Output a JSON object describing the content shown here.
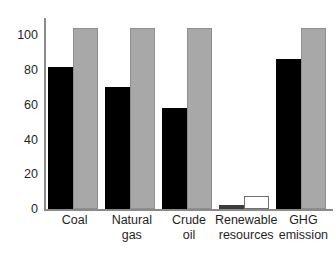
{
  "chart_data": {
    "type": "bar",
    "title": "",
    "subtitle": "",
    "xlabel": "",
    "ylabel": "",
    "ylim": [
      0,
      110
    ],
    "yticks": [
      0,
      20,
      40,
      60,
      80,
      100
    ],
    "ytick_labels": [
      "0",
      "20",
      "40",
      "60",
      "80",
      "100"
    ],
    "grid": false,
    "legend": null,
    "legend_position": "none",
    "categories": [
      "Coal",
      "Natural\ngas",
      "Crude\noil",
      "Renewable\nresources",
      "GHG\nemission"
    ],
    "series": [
      {
        "name": "series-1",
        "color": "#000000",
        "values": [
          82,
          70,
          58,
          2.5,
          86.5
        ]
      },
      {
        "name": "series-2",
        "color": "#a8a8a8",
        "values": [
          104.5,
          104,
          104,
          7.5,
          104
        ]
      }
    ],
    "bar_styles": [
      [
        "black",
        "gray"
      ],
      [
        "black",
        "gray"
      ],
      [
        "black",
        "gray"
      ],
      [
        "darkgray",
        "white"
      ],
      [
        "black",
        "gray"
      ]
    ],
    "colors": {
      "series1_black": "#000000",
      "series1_darkgray": "#3b3b3b",
      "series2_gray": "#a8a8a8",
      "series2_white": "#ffffff",
      "axis": "#8a8a8a",
      "text": "#1f1f1f",
      "background": "#ffffff"
    },
    "annotations": []
  }
}
